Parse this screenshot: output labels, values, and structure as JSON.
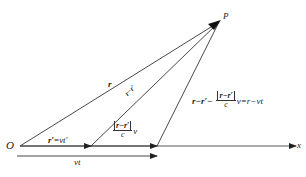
{
  "diagram": {
    "type": "vector-diagram",
    "points": {
      "origin": "O",
      "field_point": "P",
      "x_axis": "x"
    },
    "labels": {
      "r": "r",
      "r_minus_r_prime": "r−r′",
      "r_prime_eq": {
        "lhs": "r′",
        "eq": "=",
        "rhs": "vt′"
      },
      "vt": "vt",
      "frac_middle": {
        "num": "r−r′",
        "den": "c",
        "suffix": "v"
      },
      "expression": {
        "lhs": "r−r′−",
        "num": "r−r′",
        "den": "c",
        "suffix": "v=r−vt"
      }
    },
    "colors": {
      "line": "#333333",
      "text": "#222222",
      "background": "#ffffff"
    }
  }
}
